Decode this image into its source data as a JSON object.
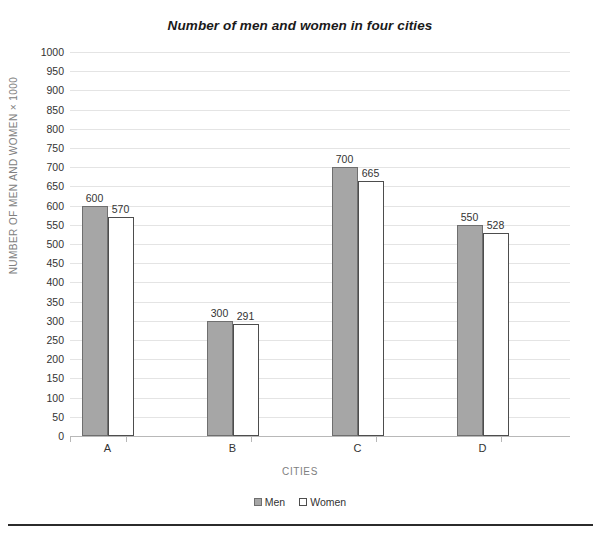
{
  "chart_data": {
    "type": "bar",
    "title": "Number of men and women in four cities",
    "xlabel": "CITIES",
    "ylabel": "NUMBER OF MEN AND WOMEN × 1000",
    "categories": [
      "A",
      "B",
      "C",
      "D"
    ],
    "series": [
      {
        "name": "Men",
        "values": [
          600,
          300,
          700,
          550
        ],
        "color": "#a6a6a6",
        "border": "#6f6f6f"
      },
      {
        "name": "Women",
        "values": [
          570,
          291,
          665,
          528
        ],
        "color": "#ffffff",
        "border": "#4d4d4d"
      }
    ],
    "ylim": [
      0,
      1000
    ],
    "ytick_step": 50,
    "yticks": [
      0,
      50,
      100,
      150,
      200,
      250,
      300,
      350,
      400,
      450,
      500,
      550,
      600,
      650,
      700,
      750,
      800,
      850,
      900,
      950,
      1000
    ],
    "grid": "horizontal",
    "legend_position": "bottom",
    "data_labels": true
  },
  "legend": {
    "items": [
      {
        "label": "Men"
      },
      {
        "label": "Women"
      }
    ]
  }
}
